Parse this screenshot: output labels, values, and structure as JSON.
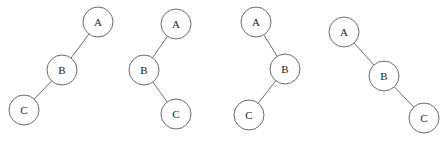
{
  "diagram": {
    "type": "binary-trees",
    "node_radius": 15,
    "colors": {
      "stroke": "#6a6a6a",
      "fill": "#ffffff",
      "text": "#222222"
    },
    "trees": [
      {
        "name": "tree-1",
        "shape": "left-left",
        "nodes": [
          {
            "id": "A",
            "label": "A",
            "x": 98,
            "y": 22
          },
          {
            "id": "B",
            "label": "B",
            "x": 62,
            "y": 70
          },
          {
            "id": "C",
            "label": "C",
            "x": 24,
            "y": 110
          }
        ],
        "edges": [
          [
            "A",
            "B"
          ],
          [
            "B",
            "C"
          ]
        ]
      },
      {
        "name": "tree-2",
        "shape": "left-right",
        "nodes": [
          {
            "id": "A",
            "label": "A",
            "x": 176,
            "y": 24
          },
          {
            "id": "B",
            "label": "B",
            "x": 144,
            "y": 70
          },
          {
            "id": "C",
            "label": "C",
            "x": 176,
            "y": 114
          }
        ],
        "edges": [
          [
            "A",
            "B"
          ],
          [
            "B",
            "C"
          ]
        ]
      },
      {
        "name": "tree-3",
        "shape": "right-left",
        "nodes": [
          {
            "id": "A",
            "label": "A",
            "x": 256,
            "y": 22
          },
          {
            "id": "B",
            "label": "B",
            "x": 285,
            "y": 69
          },
          {
            "id": "C",
            "label": "C",
            "x": 249,
            "y": 115
          }
        ],
        "edges": [
          [
            "A",
            "B"
          ],
          [
            "B",
            "C"
          ]
        ]
      },
      {
        "name": "tree-4",
        "shape": "right-right",
        "nodes": [
          {
            "id": "A",
            "label": "A",
            "x": 344,
            "y": 32
          },
          {
            "id": "B",
            "label": "B",
            "x": 384,
            "y": 76
          },
          {
            "id": "C",
            "label": "C",
            "x": 424,
            "y": 118
          }
        ],
        "edges": [
          [
            "A",
            "B"
          ],
          [
            "B",
            "C"
          ]
        ]
      }
    ]
  }
}
